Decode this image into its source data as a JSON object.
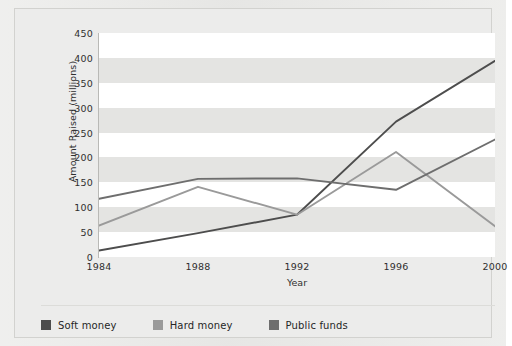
{
  "chart_data": {
    "type": "line",
    "title": "",
    "xlabel": "Year",
    "ylabel": "Amount Raised (millions)",
    "categories": [
      "1984",
      "1988",
      "1992",
      "1996",
      "2000"
    ],
    "x": [
      1984,
      1988,
      1992,
      1996,
      2000
    ],
    "xlim": [
      1984,
      2000
    ],
    "ylim": [
      0,
      450
    ],
    "yticks": [
      0,
      50,
      100,
      150,
      200,
      250,
      300,
      350,
      400,
      450
    ],
    "grid": "horizontal-bands",
    "legend_position": "bottom-left",
    "series": [
      {
        "name": "Soft money",
        "color": "#4d4d4d",
        "values": [
          13,
          48,
          85,
          272,
          394
        ]
      },
      {
        "name": "Hard money",
        "color": "#9a9a9a",
        "values": [
          63,
          141,
          85,
          211,
          62
        ]
      },
      {
        "name": "Public funds",
        "color": "#6e6e6e",
        "values": [
          117,
          157,
          158,
          135,
          236
        ]
      }
    ]
  },
  "axes": {
    "y_tick_labels": [
      "450",
      "400",
      "350",
      "300",
      "250",
      "200",
      "150",
      "100",
      "50",
      "0"
    ],
    "y_axis_title": "Amount Raised (millions)",
    "x_tick_labels": [
      "1984",
      "1988",
      "1992",
      "1996",
      "2000"
    ],
    "x_axis_title": "Year"
  },
  "legend": {
    "items": [
      {
        "label": "Soft money",
        "color": "#4d4d4d"
      },
      {
        "label": "Hard money",
        "color": "#9a9a9a"
      },
      {
        "label": "Public funds",
        "color": "#6e6e6e"
      }
    ]
  },
  "colors": {
    "card_background": "#e9e9e7",
    "plot_band_light": "#ffffff",
    "plot_band_dark": "#e4e4e2",
    "axis": "#b9b9b6",
    "text": "#2f2f2f"
  }
}
